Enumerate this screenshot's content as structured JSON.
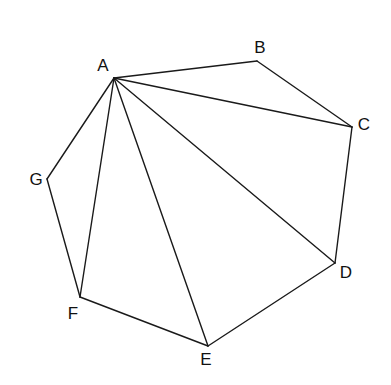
{
  "diagram": {
    "type": "heptagon-triangulation",
    "stroke_color": "#1a1a1a",
    "background": "#ffffff",
    "vertices": [
      {
        "id": "A",
        "label": "A",
        "x": 114,
        "y": 78,
        "label_x": 103,
        "label_y": 65
      },
      {
        "id": "B",
        "label": "B",
        "x": 257,
        "y": 61,
        "label_x": 260,
        "label_y": 47
      },
      {
        "id": "C",
        "label": "C",
        "x": 352,
        "y": 127,
        "label_x": 364,
        "label_y": 124
      },
      {
        "id": "D",
        "label": "D",
        "x": 335,
        "y": 263,
        "label_x": 346,
        "label_y": 272
      },
      {
        "id": "E",
        "label": "E",
        "x": 208,
        "y": 346,
        "label_x": 206,
        "label_y": 359
      },
      {
        "id": "F",
        "label": "F",
        "x": 80,
        "y": 297,
        "label_x": 73,
        "label_y": 313
      },
      {
        "id": "G",
        "label": "G",
        "x": 47,
        "y": 179,
        "label_x": 36,
        "label_y": 179
      }
    ],
    "polygon_edges": [
      [
        "A",
        "B"
      ],
      [
        "B",
        "C"
      ],
      [
        "C",
        "D"
      ],
      [
        "D",
        "E"
      ],
      [
        "E",
        "F"
      ],
      [
        "F",
        "G"
      ],
      [
        "G",
        "A"
      ]
    ],
    "diagonals": [
      [
        "A",
        "C"
      ],
      [
        "A",
        "D"
      ],
      [
        "A",
        "E"
      ],
      [
        "A",
        "F"
      ]
    ]
  }
}
